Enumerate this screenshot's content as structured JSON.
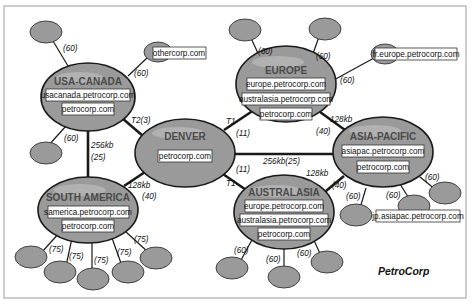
{
  "brand": "PetroCorp",
  "colors": {
    "node_fill": "#9a9a9a",
    "node_stroke": "#1a1a1a",
    "label_box": "#ffffff",
    "frame": "#9a9a9a"
  },
  "sites": {
    "usa_canada": {
      "name": "USA-CANADA",
      "domains": [
        "usacanada.petrocorp.com",
        "petrocorp.com"
      ]
    },
    "europe": {
      "name": "EUROPE",
      "domains": [
        "europe.petrocorp.com",
        "australasia.petrocorp.com",
        "petrocorp.com"
      ]
    },
    "denver": {
      "name": "DENVER",
      "domains": [
        "petrocorp.com"
      ]
    },
    "asia_pacific": {
      "name": "ASIA-PACIFIC",
      "domains": [
        "asiapac.petrocorp.com",
        "petrocorp.com"
      ]
    },
    "south_america": {
      "name": "SOUTH AMERICA",
      "domains": [
        "samerica.petrocorp.com",
        "petrocorp.com"
      ]
    },
    "australasia": {
      "name": "AUSTRALASIA",
      "domains": [
        "europe.petrocorp.com",
        "australasia.petrocorp.com",
        "petrocorp.com"
      ]
    }
  },
  "external_nodes": {
    "othercorp": "othercorp.com",
    "fr_europe": "fr.europe.petrocorp.com",
    "jp_asiapac": "jp.asiapac.petrocorp.com"
  },
  "links": {
    "usa_leaf_top": "(60)",
    "usa_othercorp": "(60)",
    "usa_leaf_bottom": "(60)",
    "usa_denver": "T2(3)",
    "usa_samerica_speed": "256kb",
    "usa_samerica_cost": "(25)",
    "europe_leaf1": "(60)",
    "europe_leaf2": "(60)",
    "europe_fr": "(60)",
    "denver_europe_speed": "T1",
    "denver_europe_cost": "(11)",
    "europe_asia_speed": "128kb",
    "europe_asia_cost": "(40)",
    "denver_asia": "256kb(25)",
    "denver_samerica_speed": "128kb",
    "denver_samerica_cost": "(40)",
    "denver_australasia_speed": "T1",
    "denver_australasia_cost": "(11)",
    "australasia_asia_speed": "128kb",
    "australasia_asia_cost": "(40)",
    "asia_leaf1": "(60)",
    "asia_leaf2": "(60)",
    "asia_leaf3": "(60)",
    "samerica_leaves": [
      "(75)",
      "(75)",
      "(75)",
      "(75)",
      "(75)"
    ],
    "australasia_leaves": [
      "(60)",
      "(60)",
      "(60)"
    ]
  }
}
